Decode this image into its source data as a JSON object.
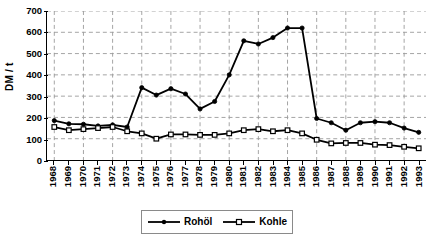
{
  "chart_data": {
    "type": "line",
    "title": "",
    "xlabel": "",
    "ylabel": "DM / t",
    "ylim": [
      0,
      700
    ],
    "ytick_step": 100,
    "yticks": [
      0,
      100,
      200,
      300,
      400,
      500,
      600,
      700
    ],
    "grid": true,
    "grid_style": "dashed",
    "legend_position": "bottom-center",
    "categories": [
      "1968",
      "1969",
      "1970",
      "1971",
      "1972",
      "1973",
      "1974",
      "1975",
      "1976",
      "1977",
      "1978",
      "1979",
      "1980",
      "1981",
      "1982",
      "1983",
      "1984",
      "1985",
      "1986",
      "1987",
      "1988",
      "1989",
      "1990",
      "1991",
      "1992",
      "1993"
    ],
    "series": [
      {
        "name": "Rohöl",
        "marker": "filled-diamond",
        "values": [
          185,
          170,
          168,
          160,
          165,
          155,
          340,
          305,
          335,
          310,
          240,
          275,
          400,
          560,
          545,
          575,
          620,
          620,
          195,
          175,
          140,
          175,
          180,
          175,
          150,
          130
        ]
      },
      {
        "name": "Kohle",
        "marker": "open-square",
        "values": [
          155,
          140,
          145,
          150,
          155,
          135,
          125,
          100,
          120,
          120,
          118,
          118,
          125,
          140,
          145,
          135,
          140,
          125,
          95,
          78,
          80,
          80,
          72,
          70,
          62,
          55
        ]
      }
    ]
  },
  "legend": {
    "entries": [
      {
        "label": "Rohöl",
        "icon": "filled-diamond-marker-icon"
      },
      {
        "label": "Kohle",
        "icon": "open-square-marker-icon"
      }
    ]
  },
  "colors": {
    "series_line": "#000000",
    "grid": "#9a9a9a",
    "axis": "#000000",
    "legend_border": "#8a8a8a",
    "background": "#ffffff"
  }
}
